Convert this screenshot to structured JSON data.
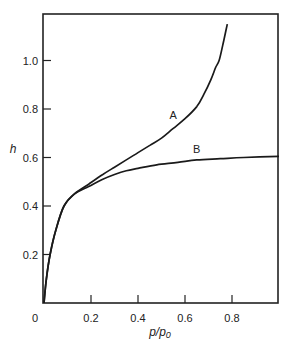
{
  "chart_data": {
    "type": "line",
    "title": "",
    "xlabel": "p/p₀",
    "ylabel": "h",
    "xlim": [
      0,
      1.0
    ],
    "ylim": [
      0,
      1.2
    ],
    "xticks": [
      0.2,
      0.4,
      0.6,
      0.8
    ],
    "xtick_labels": [
      "0.2",
      "0.4",
      "0.6",
      "0.8"
    ],
    "yticks": [
      0.2,
      0.4,
      0.6,
      0.8,
      1.0
    ],
    "ytick_labels": [
      "0.2",
      "0.4",
      "0.6",
      "0.8",
      "1.0"
    ],
    "origin_label": "0",
    "grid": false,
    "series": [
      {
        "name": "A",
        "label_at": [
          0.55,
          0.76
        ],
        "x": [
          0,
          0.01,
          0.026,
          0.05,
          0.085,
          0.13,
          0.19,
          0.25,
          0.3,
          0.35,
          0.4,
          0.45,
          0.5,
          0.55,
          0.6,
          0.65,
          0.68,
          0.71,
          0.73,
          0.745,
          0.76,
          0.78
        ],
        "y": [
          0,
          0.1,
          0.2,
          0.3,
          0.4,
          0.45,
          0.49,
          0.53,
          0.56,
          0.59,
          0.62,
          0.65,
          0.68,
          0.72,
          0.76,
          0.81,
          0.86,
          0.92,
          0.97,
          1.0,
          1.06,
          1.15
        ]
      },
      {
        "name": "B",
        "label_at": [
          0.65,
          0.62
        ],
        "x": [
          0,
          0.01,
          0.026,
          0.05,
          0.085,
          0.13,
          0.19,
          0.25,
          0.3,
          0.35,
          0.4,
          0.48,
          0.57,
          0.65,
          0.75,
          0.85,
          1.0
        ],
        "y": [
          0,
          0.1,
          0.2,
          0.3,
          0.4,
          0.45,
          0.48,
          0.51,
          0.53,
          0.545,
          0.555,
          0.57,
          0.58,
          0.59,
          0.595,
          0.6,
          0.605
        ]
      }
    ]
  }
}
